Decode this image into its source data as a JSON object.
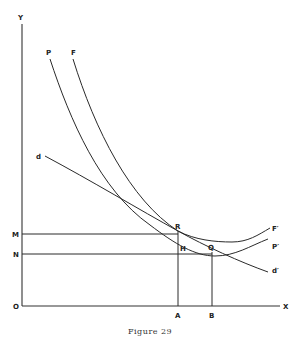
{
  "figure": {
    "caption": "Figure 29"
  },
  "axes": {
    "y_label": "Y",
    "x_label": "X",
    "origin_label": "O"
  },
  "curves": [
    {
      "id": "P",
      "start_label": "P",
      "end_label": "P′"
    },
    {
      "id": "F",
      "start_label": "F",
      "end_label": "F′"
    },
    {
      "id": "d",
      "start_label": "d",
      "end_label": "d′"
    }
  ],
  "points": {
    "R": "R",
    "H": "H",
    "Q": "Q"
  },
  "y_marks": {
    "M": "M",
    "N": "N"
  },
  "x_marks": {
    "A": "A",
    "B": "B"
  }
}
